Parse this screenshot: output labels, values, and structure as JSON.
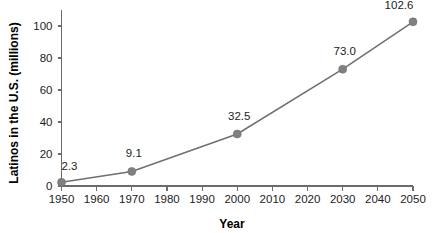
{
  "chart_data": {
    "type": "line",
    "title": "",
    "xlabel": "Year",
    "ylabel": "Latinos in the U.S. (millions)",
    "x": [
      1950,
      1970,
      2000,
      2030,
      2050
    ],
    "values": [
      2.3,
      9.1,
      32.5,
      73.0,
      102.6
    ],
    "point_labels": [
      "2.3",
      "9.1",
      "32.5",
      "73.0",
      "102.6"
    ],
    "xlim": [
      1950,
      2050
    ],
    "ylim": [
      0,
      108
    ],
    "xticks": [
      1950,
      1960,
      1970,
      1980,
      1990,
      2000,
      2010,
      2020,
      2030,
      2040,
      2050
    ],
    "xtick_labels": [
      "1950",
      "1960",
      "1970",
      "1980",
      "1990",
      "2000",
      "2010",
      "2020",
      "2030",
      "2040",
      "2050"
    ],
    "yticks": [
      0,
      20,
      40,
      60,
      80,
      100
    ],
    "ytick_labels": [
      "0",
      "20",
      "40",
      "60",
      "80",
      "100"
    ],
    "grid": false,
    "legend": "none",
    "series_color": "#707070",
    "marker_color": "#808080",
    "axis_color": "#6b6b6b",
    "text_color": "#1c1c1c",
    "background": "#ffffff"
  }
}
